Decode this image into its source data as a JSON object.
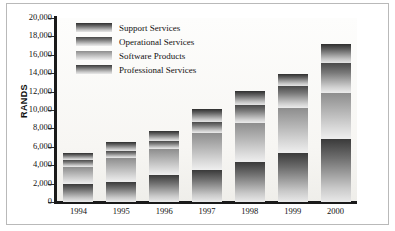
{
  "chart_data": {
    "type": "bar",
    "stacked": true,
    "title": "",
    "xlabel": "",
    "ylabel": "RANDS",
    "ylim": [
      0,
      20000
    ],
    "ytick_step": 2000,
    "grid": false,
    "legend_position": "top-left",
    "categories": [
      "1994",
      "1995",
      "1996",
      "1997",
      "1998",
      "1999",
      "2000"
    ],
    "ytick_labels": [
      "0",
      "2,000",
      "4,000",
      "6,000",
      "8,000",
      "10,000",
      "12,000",
      "14,000",
      "16,000",
      "18,000",
      "20,000"
    ],
    "series": [
      {
        "name": "Professional Services",
        "values": [
          2000,
          2200,
          2900,
          3500,
          4400,
          5300,
          6800
        ]
      },
      {
        "name": "Software Products",
        "values": [
          1800,
          2600,
          2900,
          4000,
          4200,
          4900,
          5100
        ]
      },
      {
        "name": "Operational Services",
        "values": [
          800,
          700,
          800,
          1200,
          1900,
          2400,
          3200
        ]
      },
      {
        "name": "Support Services",
        "values": [
          700,
          1000,
          1100,
          1400,
          1600,
          1300,
          2100
        ]
      }
    ],
    "totals": [
      5300,
      6500,
      7700,
      10100,
      12100,
      13900,
      17200
    ],
    "legend_entries": [
      "Support Services",
      "Operational Services",
      "Software Products",
      "Professional Services"
    ],
    "colors": {
      "support_services": "#6e6e6e",
      "operational_services": "#a9a9a9",
      "software_products": "#787878",
      "professional_services": "#636363",
      "axis": "#1a1a1a",
      "frame": "#b9b9b9",
      "plot_background": "#fbfaf8"
    }
  }
}
